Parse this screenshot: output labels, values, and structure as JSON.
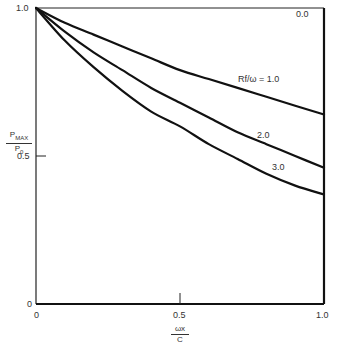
{
  "chart_data": {
    "type": "line",
    "title": "",
    "xlabel": "ωx/C",
    "ylabel": "P_MAX/P_0",
    "xlim": [
      0,
      1.0
    ],
    "ylim": [
      0,
      1.0
    ],
    "x_ticks": [
      "0",
      "0.5",
      "1.0"
    ],
    "y_ticks": [
      "0",
      "0.5",
      "1.0"
    ],
    "grid": false,
    "legend": "inline curve labels",
    "x": [
      0,
      0.1,
      0.2,
      0.3,
      0.4,
      0.5,
      0.6,
      0.7,
      0.8,
      0.9,
      1.0
    ],
    "series": [
      {
        "name": "0.0",
        "values": [
          1.0,
          1.0,
          1.0,
          1.0,
          1.0,
          1.0,
          1.0,
          1.0,
          1.0,
          1.0,
          1.0
        ]
      },
      {
        "name": "Rf/ω = 1.0",
        "values": [
          1.0,
          0.95,
          0.91,
          0.87,
          0.83,
          0.79,
          0.76,
          0.73,
          0.7,
          0.67,
          0.64
        ]
      },
      {
        "name": "2.0",
        "values": [
          1.0,
          0.92,
          0.85,
          0.79,
          0.73,
          0.68,
          0.63,
          0.58,
          0.54,
          0.5,
          0.46
        ]
      },
      {
        "name": "3.0",
        "values": [
          1.0,
          0.89,
          0.8,
          0.72,
          0.65,
          0.6,
          0.54,
          0.49,
          0.44,
          0.4,
          0.37
        ]
      }
    ],
    "annotations": [
      "0.0",
      "Rf/ω = 1.0",
      "2.0",
      "3.0"
    ]
  },
  "labels": {
    "y_top": "1.0",
    "y_mid": "0.5",
    "y_zero": "0",
    "x_zero": "0",
    "x_mid": "0.5",
    "x_one": "1.0",
    "ylabel_num": "P",
    "ylabel_num_sub": "MAX",
    "ylabel_den": "P",
    "ylabel_den_sub": "0",
    "xlabel_num": "ωx",
    "xlabel_den": "C",
    "curve_0": "0.0",
    "curve_1": "Rf/ω = 1.0",
    "curve_2": "2.0",
    "curve_3": "3.0"
  }
}
